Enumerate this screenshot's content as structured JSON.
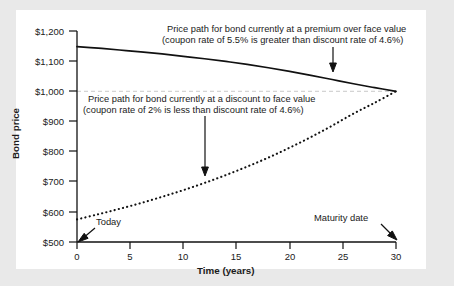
{
  "chart_data": {
    "type": "line",
    "title": "",
    "xlabel": "Time (years)",
    "ylabel": "Bond price",
    "xlim": [
      0,
      30
    ],
    "ylim": [
      500,
      1200
    ],
    "xticks": [
      "0",
      "5",
      "10",
      "15",
      "20",
      "25",
      "30"
    ],
    "xtick_values": [
      0,
      5,
      10,
      15,
      20,
      25,
      30
    ],
    "yticks": [
      "$500",
      "$600",
      "$700",
      "$800",
      "$900",
      "$1,000",
      "$1,100",
      "$1,200"
    ],
    "ytick_values": [
      500,
      600,
      700,
      800,
      900,
      1000,
      1100,
      1200
    ],
    "grid": false,
    "legend_position": "none",
    "reference_lines": [
      {
        "name": "face-value-line",
        "axis": "y",
        "value": 1000,
        "style": "dashed",
        "color": "#c9c9c9"
      }
    ],
    "series": [
      {
        "name": "premium-bond-price-path",
        "style": "solid",
        "color": "#111111",
        "coupon_rate_percent": 5.5,
        "discount_rate_percent": 4.6,
        "x": [
          0,
          2,
          4,
          6,
          8,
          10,
          12,
          14,
          16,
          18,
          20,
          22,
          24,
          26,
          28,
          30
        ],
        "values": [
          1148,
          1143,
          1137,
          1131,
          1124,
          1116,
          1108,
          1099,
          1089,
          1078,
          1066,
          1053,
          1039,
          1025,
          1012,
          1000
        ]
      },
      {
        "name": "discount-bond-price-path",
        "style": "dotted",
        "color": "#111111",
        "coupon_rate_percent": 2.0,
        "discount_rate_percent": 4.6,
        "x": [
          0,
          2,
          4,
          6,
          8,
          10,
          12,
          14,
          16,
          18,
          20,
          22,
          24,
          26,
          28,
          30
        ],
        "values": [
          575,
          592,
          610,
          629,
          650,
          672,
          696,
          722,
          750,
          780,
          813,
          848,
          886,
          926,
          962,
          1000
        ]
      }
    ],
    "annotations": [
      {
        "name": "premium-annotation",
        "line1": "Price path for bond currently at a premium over face value",
        "line2": "(coupon rate of 5.5% is greater than discount rate of 4.6%)",
        "arrow_to_x": 24,
        "arrow_to_y": 1055
      },
      {
        "name": "discount-annotation",
        "line1": "Price path for bond currently at a discount to face value",
        "line2": "(coupon rate of 2% is less than discount rate of 4.6%)",
        "arrow_to_x": 13,
        "arrow_to_y": 690
      },
      {
        "name": "today-callout",
        "text": "Today",
        "arrow_to_x": 0,
        "arrow_to_y": 500
      },
      {
        "name": "maturity-callout",
        "text": "Maturity date",
        "arrow_to_x": 30,
        "arrow_to_y": 500
      }
    ]
  }
}
